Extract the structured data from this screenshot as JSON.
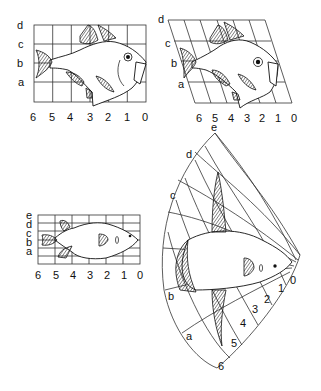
{
  "figure": {
    "panels": [
      {
        "id": "rectangular-grid-fish",
        "row_labels": [
          "d",
          "c",
          "b",
          "a"
        ],
        "col_labels": [
          "6",
          "5",
          "4",
          "3",
          "2",
          "1",
          "0"
        ]
      },
      {
        "id": "oblique-grid-fish",
        "row_labels": [
          "d",
          "c",
          "b",
          "a"
        ],
        "col_labels": [
          "6",
          "5",
          "4",
          "3",
          "2",
          "1",
          "0"
        ]
      },
      {
        "id": "rectangular-grid-puffer",
        "row_labels": [
          "e",
          "d",
          "c",
          "b",
          "a"
        ],
        "col_labels": [
          "6",
          "5",
          "4",
          "3",
          "2",
          "1",
          "0"
        ]
      },
      {
        "id": "radial-grid-sunfish",
        "row_labels": [
          "e",
          "d",
          "c",
          "b",
          "a"
        ],
        "col_labels": [
          "0",
          "1",
          "2",
          "3",
          "4",
          "5",
          "6"
        ]
      }
    ]
  }
}
